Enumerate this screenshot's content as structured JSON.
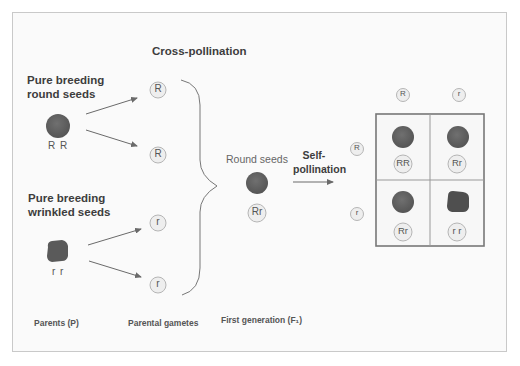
{
  "title": "Cross-pollination",
  "parents": {
    "round": {
      "heading_line1": "Pure breeding",
      "heading_line2": "round seeds",
      "genotype": "R R"
    },
    "wrinkled": {
      "heading_line1": "Pure breeding",
      "heading_line2": "wrinkled seeds",
      "genotype": "r r"
    }
  },
  "gametes": [
    "R",
    "R",
    "r",
    "r"
  ],
  "f1": {
    "label": "Round seeds",
    "genotype": "Rr"
  },
  "self_pollination": {
    "line1": "Self-",
    "line2": "pollination"
  },
  "punnett": {
    "col_headers": [
      "R",
      "r"
    ],
    "row_headers": [
      "R",
      "r"
    ],
    "cells": [
      {
        "genotype": "RR",
        "shape": "round"
      },
      {
        "genotype": "Rr",
        "shape": "round"
      },
      {
        "genotype": "Rr",
        "shape": "round"
      },
      {
        "genotype": "r r",
        "shape": "wrinkled"
      }
    ]
  },
  "footer": {
    "parents": "Parents (P)",
    "gametes": "Parental gametes",
    "first_gen": "First generation (F₁)"
  },
  "colors": {
    "seed": "#5f5f5f",
    "circle_fill": "#eeeeee",
    "circle_stroke": "#b5b5b5",
    "line": "#6a6a6a"
  }
}
